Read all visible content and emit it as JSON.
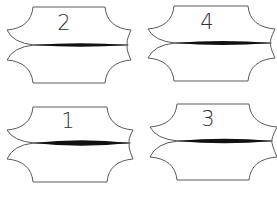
{
  "diagram": {
    "panels": [
      {
        "id": "panel-2",
        "label": "2",
        "origin": [
          0,
          0
        ],
        "top_y": 7,
        "bottom_y": 83,
        "edge_left_x": 33,
        "edge_right_x": 105,
        "tip_left_x": 7,
        "tip_right_x": 131,
        "tip_upper_y": 30,
        "tip_lower_y": 60,
        "waist_y": 45,
        "seam_max_thickness": 3.5,
        "label_pos": [
          64,
          30
        ]
      },
      {
        "id": "panel-4",
        "label": "4",
        "origin": [
          0,
          0
        ],
        "top_y": 6,
        "bottom_y": 81,
        "edge_left_x": 174,
        "edge_right_x": 248,
        "tip_left_x": 148,
        "tip_right_x": 275,
        "tip_upper_y": 29,
        "tip_lower_y": 58,
        "waist_y": 43,
        "seam_max_thickness": 4,
        "label_pos": [
          207,
          29
        ]
      },
      {
        "id": "panel-1",
        "label": "1",
        "origin": [
          0,
          0
        ],
        "top_y": 107,
        "bottom_y": 182,
        "edge_left_x": 33,
        "edge_right_x": 107,
        "tip_left_x": 7,
        "tip_right_x": 133,
        "tip_upper_y": 130,
        "tip_lower_y": 159,
        "waist_y": 143,
        "seam_max_thickness": 5.5,
        "label_pos": [
          68,
          128
        ]
      },
      {
        "id": "panel-3",
        "label": "3",
        "origin": [
          0,
          0
        ],
        "top_y": 104,
        "bottom_y": 180,
        "edge_left_x": 177,
        "edge_right_x": 249,
        "tip_left_x": 150,
        "tip_right_x": 277,
        "tip_upper_y": 127,
        "tip_lower_y": 157,
        "waist_y": 141,
        "seam_max_thickness": 4.5,
        "label_pos": [
          208,
          126
        ]
      }
    ],
    "colors": {
      "outline": "#5a5a5a",
      "seam": "#111111",
      "label": "#333333",
      "background": "#ffffff"
    }
  }
}
